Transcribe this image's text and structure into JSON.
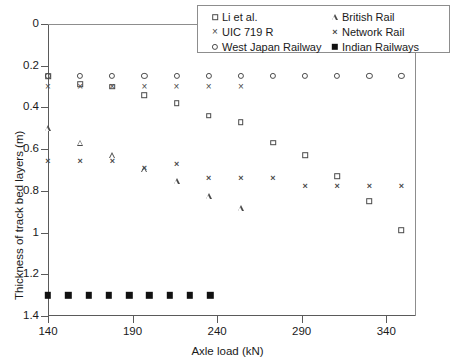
{
  "chart_data": {
    "type": "scatter",
    "title": "",
    "xlabel": "Axle load (kN)",
    "ylabel": "Thickness of track bed layers (m)",
    "xlim": [
      140,
      357
    ],
    "ylim": [
      0,
      1.4
    ],
    "y_inverted": true,
    "grid": false,
    "legend_position": "top-right",
    "xticks": [
      140,
      190,
      240,
      290,
      340
    ],
    "yticks": [
      0,
      0.2,
      0.4,
      0.6,
      0.8,
      1,
      1.2,
      1.4
    ],
    "xtick_labels": [
      "140",
      "190",
      "240",
      "290",
      "340"
    ],
    "ytick_labels": [
      "0",
      "0.2",
      "0.4",
      "0.6",
      "0.8",
      "1",
      "1.2",
      "1.4"
    ],
    "series": [
      {
        "name": "Li et al.",
        "marker": "open-square",
        "points": [
          {
            "x": 140,
            "y": 0.25
          },
          {
            "x": 159,
            "y": 0.29
          },
          {
            "x": 178,
            "y": 0.3
          },
          {
            "x": 197,
            "y": 0.34
          },
          {
            "x": 216,
            "y": 0.38
          },
          {
            "x": 235,
            "y": 0.44
          },
          {
            "x": 254,
            "y": 0.47
          },
          {
            "x": 273,
            "y": 0.57
          },
          {
            "x": 292,
            "y": 0.63
          },
          {
            "x": 311,
            "y": 0.73
          },
          {
            "x": 330,
            "y": 0.85
          },
          {
            "x": 349,
            "y": 0.99
          },
          {
            "x": 360,
            "y": 1.12
          },
          {
            "x": 372,
            "y": 1.21
          }
        ]
      },
      {
        "name": "UIC 719 R",
        "marker": "x",
        "points": [
          {
            "x": 140,
            "y": 0.3
          },
          {
            "x": 159,
            "y": 0.3
          },
          {
            "x": 178,
            "y": 0.3
          },
          {
            "x": 197,
            "y": 0.3
          },
          {
            "x": 216,
            "y": 0.3
          },
          {
            "x": 235,
            "y": 0.3
          },
          {
            "x": 254,
            "y": 0.3
          }
        ]
      },
      {
        "name": "West Japan Railway",
        "marker": "open-circle",
        "points": [
          {
            "x": 140,
            "y": 0.25
          },
          {
            "x": 159,
            "y": 0.25
          },
          {
            "x": 178,
            "y": 0.25
          },
          {
            "x": 197,
            "y": 0.25
          },
          {
            "x": 216,
            "y": 0.25
          },
          {
            "x": 235,
            "y": 0.25
          },
          {
            "x": 254,
            "y": 0.25
          },
          {
            "x": 273,
            "y": 0.25
          },
          {
            "x": 292,
            "y": 0.25
          },
          {
            "x": 311,
            "y": 0.25
          },
          {
            "x": 330,
            "y": 0.25
          },
          {
            "x": 349,
            "y": 0.25
          }
        ]
      },
      {
        "name": "British Rail",
        "marker": "open-triangle",
        "points": [
          {
            "x": 140,
            "y": 0.5
          },
          {
            "x": 159,
            "y": 0.54
          },
          {
            "x": 178,
            "y": 0.57
          },
          {
            "x": 197,
            "y": 0.61
          },
          {
            "x": 216,
            "y": 0.64
          },
          {
            "x": 235,
            "y": 0.68
          },
          {
            "x": 254,
            "y": 0.71
          }
        ]
      },
      {
        "name": "Network Rail",
        "marker": "x-bold",
        "points": [
          {
            "x": 140,
            "y": 0.655
          },
          {
            "x": 159,
            "y": 0.655
          },
          {
            "x": 178,
            "y": 0.655
          },
          {
            "x": 197,
            "y": 0.69
          },
          {
            "x": 216,
            "y": 0.67
          },
          {
            "x": 235,
            "y": 0.74
          },
          {
            "x": 254,
            "y": 0.74
          },
          {
            "x": 273,
            "y": 0.74
          },
          {
            "x": 292,
            "y": 0.775
          },
          {
            "x": 311,
            "y": 0.775
          },
          {
            "x": 330,
            "y": 0.775
          },
          {
            "x": 349,
            "y": 0.775
          }
        ]
      },
      {
        "name": "Indian Railways",
        "marker": "filled-square",
        "points": [
          {
            "x": 140,
            "y": 1.3
          },
          {
            "x": 152,
            "y": 1.3
          },
          {
            "x": 164,
            "y": 1.3
          },
          {
            "x": 176,
            "y": 1.3
          },
          {
            "x": 188,
            "y": 1.3
          },
          {
            "x": 200,
            "y": 1.3
          },
          {
            "x": 212,
            "y": 1.3
          },
          {
            "x": 224,
            "y": 1.3
          },
          {
            "x": 236,
            "y": 1.3
          }
        ]
      }
    ]
  },
  "legend": {
    "entries": [
      {
        "label": "Li et al.",
        "marker": "open-square"
      },
      {
        "label": "UIC 719 R",
        "marker": "x"
      },
      {
        "label": "West Japan Railway",
        "marker": "open-circle"
      },
      {
        "label": "British Rail",
        "marker": "open-triangle"
      },
      {
        "label": "Network Rail",
        "marker": "x-bold"
      },
      {
        "label": "Indian Railways",
        "marker": "filled-square"
      }
    ]
  },
  "colors": {
    "marker": "#4a4a4a",
    "filled_marker": "#111111",
    "axis": "#5a5a5a",
    "frame": "#8d8d8d",
    "background": "#ffffff"
  }
}
